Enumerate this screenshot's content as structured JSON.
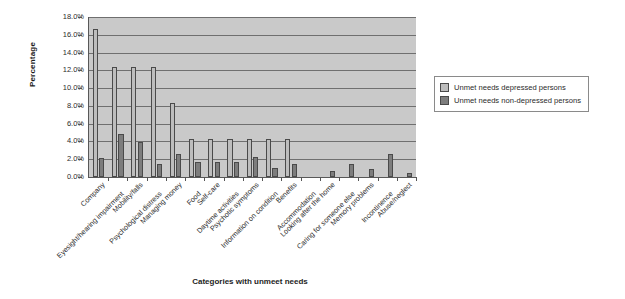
{
  "chart_data": {
    "type": "bar",
    "title": "",
    "xlabel": "Categories with unmeet needs",
    "ylabel": "Percentage",
    "ylim": [
      0,
      18
    ],
    "ytick_labels": [
      "18.0%",
      "16.0%",
      "14.0%",
      "12.0%",
      "10.0%",
      "8.0%",
      "6.0%",
      "4.0%",
      "2.0%",
      "0.0%"
    ],
    "ytick_values": [
      18,
      16,
      14,
      12,
      10,
      8,
      6,
      4,
      2,
      0
    ],
    "grid": true,
    "legend_position": "right",
    "categories": [
      "Company",
      "Eyesight/hearing impairment",
      "Mobility/falls",
      "Psychological distress",
      "Managing money",
      "Food",
      "Self-care",
      "Daytime activities",
      "Psychotic symptoms",
      "Information on condition",
      "Benefits",
      "Accommodation",
      "Looking after the home",
      "Caring for someone else",
      "Memory problems",
      "Incontinence",
      "Abuse/neglect"
    ],
    "series": [
      {
        "name": "Unmet needs depressed persons",
        "color": "#bdbdbd",
        "values": [
          16.7,
          12.4,
          12.4,
          12.4,
          8.3,
          4.3,
          4.3,
          4.3,
          4.3,
          4.3,
          4.3,
          0,
          0,
          0,
          0,
          0,
          0
        ]
      },
      {
        "name": "Unmet needs non-depressed persons",
        "color": "#7d7d7d",
        "values": [
          2.1,
          4.8,
          3.9,
          1.5,
          2.6,
          1.7,
          1.7,
          1.7,
          2.2,
          1.0,
          1.5,
          0.0,
          0.7,
          1.5,
          0.9,
          2.6,
          0.5
        ]
      }
    ]
  },
  "legend": {
    "items": [
      {
        "label": "Unmet needs depressed persons",
        "swatch": "light"
      },
      {
        "label": "Unmet needs non-depressed persons",
        "swatch": "dark"
      }
    ]
  }
}
